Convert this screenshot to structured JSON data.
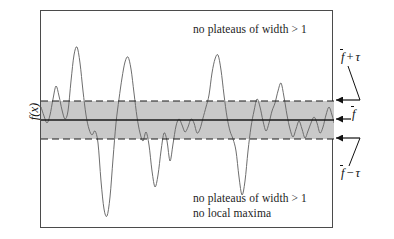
{
  "figure": {
    "width": 394,
    "height": 239,
    "background": "#ffffff"
  },
  "axis": {
    "y_label": "f(x)"
  },
  "annotations": {
    "top_note": "no plateaus of width > 1",
    "bottom_note_1": "no plateaus of width > 1",
    "bottom_note_2": "no local maxima"
  },
  "labels": {
    "upper": {
      "base": "f",
      "op": "+",
      "symbol": "τ"
    },
    "middle": {
      "base": "f"
    },
    "lower": {
      "base": "f",
      "op": "−",
      "symbol": "τ"
    }
  },
  "colors": {
    "band_fill": "#c9c9c9",
    "curve": "#6e6e6e",
    "frame": "#4b4b4b",
    "mean_line": "#1a1a1a",
    "dashed_line": "#1a1a1a",
    "text": "#111111"
  },
  "chart_data": {
    "type": "line",
    "title": "",
    "xlabel": "",
    "ylabel": "f(x)",
    "xlim": [
      0,
      293
    ],
    "ylim": [
      0,
      218
    ],
    "grid": false,
    "legend": null,
    "bands": [
      {
        "name": "tolerance band",
        "y_top": 90,
        "y_bottom": 128,
        "fill": "#c9c9c9",
        "top_label": "f-bar + tau",
        "bottom_label": "f-bar - tau"
      }
    ],
    "reference_lines": [
      {
        "name": "mean",
        "y": 109,
        "style": "solid",
        "label": "f-bar"
      },
      {
        "name": "upper_tolerance",
        "y": 90,
        "style": "dashed",
        "label": "f-bar + tau"
      },
      {
        "name": "lower_tolerance",
        "y": 128,
        "style": "dashed",
        "label": "f-bar - tau"
      }
    ],
    "series": [
      {
        "name": "f(x)",
        "color": "#6e6e6e",
        "points": [
          [
            0,
            96
          ],
          [
            3,
            105
          ],
          [
            6,
            112
          ],
          [
            9,
            104
          ],
          [
            12,
            88
          ],
          [
            15,
            75
          ],
          [
            18,
            85
          ],
          [
            21,
            99
          ],
          [
            24,
            108
          ],
          [
            27,
            100
          ],
          [
            30,
            70
          ],
          [
            33,
            44
          ],
          [
            36,
            36
          ],
          [
            39,
            52
          ],
          [
            42,
            80
          ],
          [
            45,
            104
          ],
          [
            48,
            118
          ],
          [
            51,
            124
          ],
          [
            54,
            120
          ],
          [
            57,
            132
          ],
          [
            60,
            170
          ],
          [
            63,
            198
          ],
          [
            66,
            205
          ],
          [
            69,
            186
          ],
          [
            72,
            148
          ],
          [
            75,
            112
          ],
          [
            78,
            88
          ],
          [
            81,
            67
          ],
          [
            84,
            51
          ],
          [
            87,
            46
          ],
          [
            90,
            58
          ],
          [
            93,
            82
          ],
          [
            96,
            106
          ],
          [
            99,
            122
          ],
          [
            102,
            130
          ],
          [
            105,
            121
          ],
          [
            108,
            134
          ],
          [
            111,
            160
          ],
          [
            114,
            176
          ],
          [
            117,
            164
          ],
          [
            120,
            140
          ],
          [
            123,
            122
          ],
          [
            126,
            130
          ],
          [
            129,
            150
          ],
          [
            132,
            133
          ],
          [
            135,
            115
          ],
          [
            138,
            108
          ],
          [
            141,
            114
          ],
          [
            144,
            121
          ],
          [
            147,
            116
          ],
          [
            150,
            108
          ],
          [
            153,
            112
          ],
          [
            156,
            122
          ],
          [
            159,
            118
          ],
          [
            162,
            107
          ],
          [
            165,
            96
          ],
          [
            168,
            84
          ],
          [
            171,
            62
          ],
          [
            174,
            48
          ],
          [
            177,
            44
          ],
          [
            180,
            59
          ],
          [
            183,
            84
          ],
          [
            186,
            106
          ],
          [
            189,
            120
          ],
          [
            192,
            128
          ],
          [
            195,
            140
          ],
          [
            198,
            166
          ],
          [
            201,
            184
          ],
          [
            204,
            170
          ],
          [
            207,
            140
          ],
          [
            210,
            116
          ],
          [
            213,
            100
          ],
          [
            216,
            88
          ],
          [
            219,
            96
          ],
          [
            222,
            110
          ],
          [
            225,
            120
          ],
          [
            228,
            112
          ],
          [
            231,
            100
          ],
          [
            234,
            92
          ],
          [
            237,
            80
          ],
          [
            240,
            72
          ],
          [
            243,
            86
          ],
          [
            246,
            104
          ],
          [
            249,
            118
          ],
          [
            252,
            126
          ],
          [
            255,
            118
          ],
          [
            258,
            110
          ],
          [
            261,
            118
          ],
          [
            264,
            127
          ],
          [
            267,
            120
          ],
          [
            270,
            112
          ],
          [
            273,
            106
          ],
          [
            276,
            112
          ],
          [
            279,
            122
          ],
          [
            282,
            116
          ],
          [
            285,
            104
          ],
          [
            288,
            96
          ],
          [
            291,
            104
          ],
          [
            293,
            112
          ]
        ]
      }
    ]
  }
}
